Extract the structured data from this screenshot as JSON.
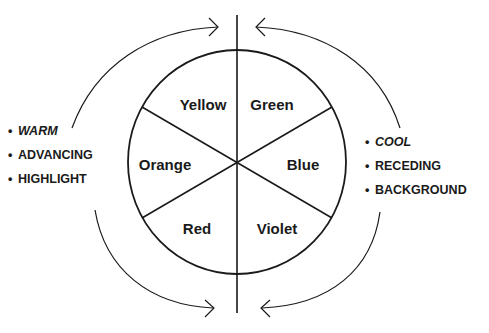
{
  "diagram": {
    "type": "color-wheel",
    "segments": [
      {
        "name": "Yellow",
        "position": "upper-left"
      },
      {
        "name": "Green",
        "position": "upper-right"
      },
      {
        "name": "Blue",
        "position": "right"
      },
      {
        "name": "Violet",
        "position": "lower-right"
      },
      {
        "name": "Red",
        "position": "lower-left"
      },
      {
        "name": "Orange",
        "position": "left"
      }
    ],
    "warm_side": {
      "bullet": "•",
      "items": [
        "WARM",
        "ADVANCING",
        "HIGHLIGHT"
      ]
    },
    "cool_side": {
      "bullet": "•",
      "items": [
        "COOL",
        "RECEDING",
        "BACKGROUND"
      ]
    },
    "colors": {
      "line": "#1a1a1a",
      "background": "#ffffff"
    }
  }
}
